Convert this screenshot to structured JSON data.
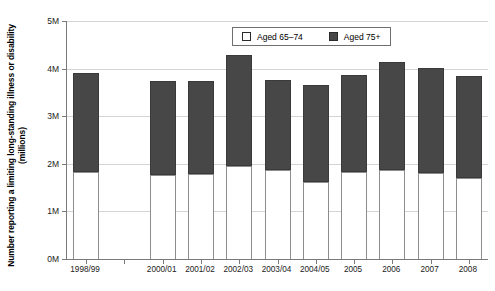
{
  "chart_data": {
    "type": "bar",
    "subtype": "stacked-vertical",
    "title": "",
    "xlabel": "",
    "ylabel": "Number reporting a limiting long-standing illness or disability (millions)",
    "categories": [
      "1998/99",
      "1999/00",
      "2000/01",
      "2001/02",
      "2002/03",
      "2003/04",
      "2004/05",
      "2005",
      "2006",
      "2007",
      "2008"
    ],
    "xtick_labels": [
      "1998/99",
      "",
      "2000/01",
      "2001/02",
      "2002/03",
      "2003/04",
      "2004/05",
      "2005",
      "2006",
      "2007",
      "2008"
    ],
    "ylim": [
      0,
      5000000
    ],
    "ytick_values": [
      0,
      1000000,
      2000000,
      3000000,
      4000000,
      5000000
    ],
    "ytick_labels": [
      "0M",
      "1M",
      "2M",
      "3M",
      "4M",
      "5M"
    ],
    "grid": true,
    "grid_axis": "y",
    "legend_position": "top-center-inside",
    "series": [
      {
        "name": "Aged 65–74",
        "color": "#ffffff",
        "edge_color": "#8d8d8d",
        "values": [
          1830000,
          null,
          1770000,
          1780000,
          1960000,
          1860000,
          1620000,
          1820000,
          1880000,
          1810000,
          1700000
        ]
      },
      {
        "name": "Aged 75+",
        "color": "#474747",
        "edge_color": "#3a3a3a",
        "values": [
          2070000,
          null,
          1980000,
          1950000,
          2320000,
          1900000,
          2030000,
          2050000,
          2250000,
          2200000,
          2140000
        ]
      }
    ],
    "totals": [
      3900000,
      null,
      3750000,
      3730000,
      4280000,
      3760000,
      3650000,
      3870000,
      4130000,
      4010000,
      3840000
    ]
  },
  "legend": {
    "entries": [
      {
        "label": "Aged 65–74",
        "swatch": "open"
      },
      {
        "label": "Aged 75+",
        "swatch": "filled"
      }
    ]
  },
  "axes": {
    "y_title": "Number reporting a limiting long-standing illness or disability (millions)"
  },
  "colors": {
    "bar_upper": "#474747",
    "bar_lower": "#ffffff",
    "grid": "#d4d4d4",
    "axis": "#7a7a7a",
    "text": "#1a1a1a"
  }
}
